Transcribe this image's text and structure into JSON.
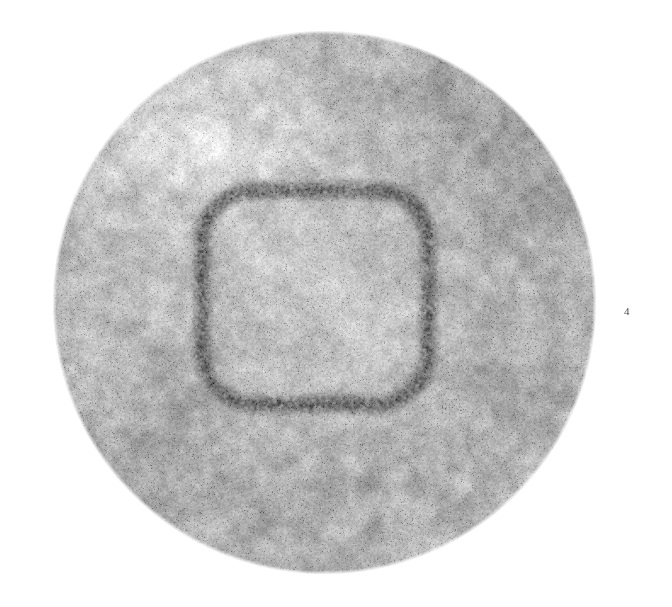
{
  "figure": {
    "number_label": "4",
    "caption": "",
    "background_color": "#ffffff",
    "width": 672,
    "height": 607
  },
  "micrograph": {
    "kind": "electron-micrograph",
    "subject": "virus particle (rounded-square capsid within circular field)",
    "field": {
      "shape": "circle",
      "center_x": 324,
      "center_y": 302,
      "radius": 272,
      "base_gray": "#b9b9b9",
      "edge_softness_px": 4
    },
    "capsid": {
      "shape": "rounded-square",
      "center_x": 315,
      "center_y": 297,
      "half_width": 113,
      "half_height": 107,
      "corner_radius": 52,
      "band_thickness": 19,
      "band_gray": "#4a4a4a",
      "interior_gray": "#cfcfcf"
    },
    "shading_blobs": [
      {
        "cx": 175,
        "cy": 130,
        "r": 150,
        "delta": 26
      },
      {
        "cx": 250,
        "cy": 95,
        "r": 120,
        "delta": 18
      },
      {
        "cx": 470,
        "cy": 120,
        "r": 135,
        "delta": -24
      },
      {
        "cx": 545,
        "cy": 230,
        "r": 115,
        "delta": -14
      },
      {
        "cx": 560,
        "cy": 360,
        "r": 125,
        "delta": -10
      },
      {
        "cx": 150,
        "cy": 440,
        "r": 140,
        "delta": -20
      },
      {
        "cx": 300,
        "cy": 520,
        "r": 130,
        "delta": -14
      },
      {
        "cx": 420,
        "cy": 500,
        "r": 120,
        "delta": -8
      },
      {
        "cx": 110,
        "cy": 300,
        "r": 120,
        "delta": 8
      },
      {
        "cx": 320,
        "cy": 300,
        "r": 95,
        "delta": 16
      },
      {
        "cx": 255,
        "cy": 255,
        "r": 55,
        "delta": 14
      },
      {
        "cx": 380,
        "cy": 330,
        "r": 60,
        "delta": 10
      },
      {
        "cx": 300,
        "cy": 175,
        "r": 70,
        "delta": 12
      },
      {
        "cx": 490,
        "cy": 420,
        "r": 90,
        "delta": -12
      },
      {
        "cx": 205,
        "cy": 170,
        "r": 70,
        "delta": 10
      }
    ],
    "grain": {
      "amplitude": 30,
      "fine_amplitude": 16,
      "speckle_density": 0.05
    },
    "colors": {
      "white": "#ffffff",
      "light_gray": "#dedede",
      "mid_gray": "#b2b2b2",
      "dark_gray": "#555555",
      "label_gray": "#4a4a4a"
    }
  },
  "chart_data": {
    "type": "heatmap",
    "title": "",
    "xlabel": "",
    "ylabel": ""
  }
}
